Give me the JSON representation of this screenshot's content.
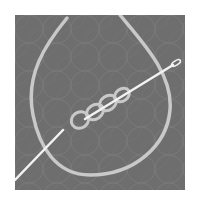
{
  "illustration": {
    "title": "Needle threading through chain stitch loops",
    "icon": "needle-thread-icon",
    "colors": {
      "background": "#ffffff",
      "panel": "#6e6e6e",
      "pattern": "#7c7c7c",
      "thread": "#c9c9c9",
      "needle": "#f2f2f2"
    }
  }
}
